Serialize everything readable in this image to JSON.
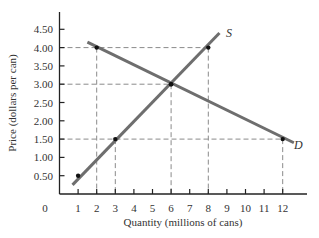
{
  "chart_data": {
    "type": "line",
    "title": "",
    "xlabel": "Quantity (millions of cans)",
    "ylabel": "Price (dollars per can)",
    "origin_label": "0",
    "xlim": [
      0,
      13
    ],
    "ylim": [
      0,
      4.75
    ],
    "x_ticks": [
      1,
      2,
      3,
      4,
      5,
      6,
      7,
      8,
      9,
      10,
      11,
      12
    ],
    "y_ticks": [
      0.5,
      1.0,
      1.5,
      2.0,
      2.5,
      3.0,
      3.5,
      4.0,
      4.5
    ],
    "y_tick_labels": [
      "0.50",
      "1.00",
      "1.50",
      "2.00",
      "2.50",
      "3.00",
      "3.50",
      "4.00",
      "4.50"
    ],
    "grid": false,
    "series": [
      {
        "name": "S",
        "label": "Supply",
        "color": "#6e6e6e",
        "line_from": [
          0.7,
          0.25
        ],
        "line_to": [
          8.6,
          4.4
        ],
        "points": [
          [
            1,
            0.5
          ],
          [
            3,
            1.5
          ],
          [
            6,
            3.0
          ],
          [
            8,
            4.0
          ]
        ]
      },
      {
        "name": "D",
        "label": "Demand",
        "color": "#6e6e6e",
        "line_from": [
          1.5,
          4.15
        ],
        "line_to": [
          12.6,
          1.4
        ],
        "points": [
          [
            2,
            4.0
          ],
          [
            6,
            3.0
          ],
          [
            12,
            1.5
          ]
        ]
      }
    ],
    "reference_lines": {
      "horizontal": [
        {
          "y": 4.0,
          "x_to": 8
        },
        {
          "y": 3.0,
          "x_to": 6
        },
        {
          "y": 1.5,
          "x_to": 12
        }
      ],
      "vertical": [
        {
          "x": 2,
          "y_to": 4.0
        },
        {
          "x": 3,
          "y_to": 1.5
        },
        {
          "x": 6,
          "y_to": 3.0
        },
        {
          "x": 8,
          "y_to": 4.0
        },
        {
          "x": 12,
          "y_to": 1.5
        }
      ]
    },
    "equilibrium": {
      "quantity": 6,
      "price": 3.0
    },
    "colors": {
      "axis": "#222222",
      "curve": "#6e6e6e",
      "dash": "#8a8a8a",
      "point": "#111111"
    }
  }
}
